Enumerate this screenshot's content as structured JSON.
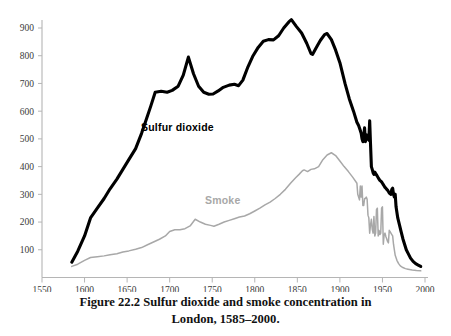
{
  "figure": {
    "caption_line1": "Figure 22.2 Sulfur dioxide and smoke concentration in",
    "caption_line2": "London, 1585–2000."
  },
  "colors": {
    "sulfur_dioxide": "#000000",
    "smoke": "#a8a8a8",
    "axis": "#b5b5b5",
    "tick_text": "#3a3a3a",
    "background": "#ffffff"
  },
  "chart_data": {
    "type": "line",
    "title": "Figure 22.2 Sulfur dioxide and smoke concentration in London, 1585–2000.",
    "xlabel": "",
    "ylabel": "",
    "xlim": [
      1550,
      2000
    ],
    "ylim": [
      0,
      960
    ],
    "grid": false,
    "legend": "inline-annotations",
    "xticks": [
      1550,
      1600,
      1650,
      1700,
      1750,
      1800,
      1850,
      1900,
      1950,
      2000
    ],
    "yticks": [
      100,
      200,
      300,
      400,
      500,
      600,
      700,
      800,
      900
    ],
    "xtick_labels": [
      "1550",
      "1600",
      "1650",
      "1700",
      "1750",
      "1800",
      "1850",
      "1900",
      "1950",
      "2000"
    ],
    "ytick_labels": [
      "900",
      "800",
      "700",
      "600",
      "500",
      "400",
      "300",
      "200",
      "100"
    ],
    "annotations": [
      {
        "text": "Sulfur dioxide",
        "x": 1700,
        "y": 540,
        "series": "Sulfur dioxide"
      },
      {
        "text": "Smoke",
        "x": 1795,
        "y": 290,
        "series": "Smoke"
      }
    ],
    "series": [
      {
        "name": "Sulfur dioxide",
        "color": "#000000",
        "linewidth": 3.1,
        "x": [
          1585,
          1592,
          1600,
          1607,
          1615,
          1623,
          1630,
          1638,
          1645,
          1652,
          1660,
          1667,
          1672,
          1678,
          1683,
          1690,
          1697,
          1703,
          1710,
          1716,
          1722,
          1728,
          1734,
          1740,
          1746,
          1751,
          1757,
          1763,
          1770,
          1776,
          1781,
          1786,
          1792,
          1798,
          1804,
          1810,
          1816,
          1822,
          1828,
          1834,
          1840,
          1843,
          1849,
          1855,
          1861,
          1866,
          1868,
          1872,
          1877,
          1882,
          1885,
          1890,
          1895,
          1900,
          1906,
          1911,
          1916,
          1920,
          1922,
          1924,
          1925,
          1926,
          1927,
          1928,
          1929,
          1930,
          1931,
          1932,
          1933,
          1934,
          1935,
          1936,
          1937,
          1938,
          1939,
          1940,
          1941,
          1942,
          1943,
          1944,
          1945,
          1946,
          1947,
          1948,
          1949,
          1950,
          1951,
          1952,
          1953,
          1954,
          1955,
          1956,
          1957,
          1958,
          1959,
          1960,
          1961,
          1962,
          1963,
          1964,
          1965,
          1966,
          1968,
          1970,
          1972,
          1974,
          1976,
          1978,
          1980,
          1983,
          1986,
          1989,
          1992,
          1995
        ],
        "y": [
          55,
          95,
          150,
          215,
          250,
          285,
          320,
          355,
          390,
          425,
          465,
          520,
          565,
          620,
          668,
          672,
          668,
          675,
          690,
          730,
          795,
          735,
          690,
          668,
          661,
          662,
          673,
          686,
          694,
          697,
          692,
          712,
          760,
          800,
          830,
          852,
          858,
          857,
          872,
          900,
          922,
          930,
          905,
          882,
          845,
          808,
          805,
          828,
          855,
          876,
          880,
          858,
          820,
          775,
          700,
          645,
          600,
          560,
          548,
          530,
          520,
          500,
          490,
          510,
          540,
          490,
          515,
          505,
          500,
          495,
          565,
          480,
          400,
          390,
          378,
          372,
          380,
          375,
          370,
          365,
          360,
          355,
          350,
          348,
          345,
          340,
          335,
          330,
          325,
          322,
          318,
          315,
          310,
          305,
          302,
          300,
          318,
          322,
          300,
          290,
          300,
          255,
          215,
          190,
          165,
          140,
          120,
          100,
          88,
          70,
          58,
          50,
          45,
          40
        ]
      },
      {
        "name": "Smoke",
        "color": "#a8a8a8",
        "linewidth": 1.5,
        "x": [
          1585,
          1592,
          1600,
          1607,
          1615,
          1623,
          1630,
          1638,
          1645,
          1652,
          1660,
          1667,
          1674,
          1681,
          1688,
          1695,
          1700,
          1706,
          1712,
          1718,
          1724,
          1730,
          1736,
          1742,
          1748,
          1752,
          1758,
          1764,
          1770,
          1776,
          1782,
          1788,
          1794,
          1800,
          1806,
          1812,
          1818,
          1824,
          1830,
          1836,
          1842,
          1848,
          1852,
          1856,
          1858,
          1862,
          1866,
          1870,
          1875,
          1880,
          1885,
          1890,
          1895,
          1900,
          1905,
          1910,
          1915,
          1920,
          1921,
          1922,
          1923,
          1924,
          1925,
          1926,
          1927,
          1928,
          1929,
          1930,
          1931,
          1932,
          1933,
          1934,
          1935,
          1936,
          1937,
          1938,
          1939,
          1940,
          1941,
          1942,
          1943,
          1944,
          1945,
          1946,
          1947,
          1948,
          1949,
          1950,
          1951,
          1952,
          1953,
          1954,
          1955,
          1956,
          1957,
          1958,
          1959,
          1960,
          1961,
          1962,
          1963,
          1964,
          1965,
          1967,
          1969,
          1971,
          1974,
          1977,
          1980,
          1985,
          1990,
          1995
        ],
        "y": [
          40,
          48,
          62,
          72,
          75,
          78,
          82,
          86,
          92,
          96,
          102,
          108,
          118,
          128,
          138,
          150,
          166,
          172,
          172,
          176,
          186,
          210,
          200,
          192,
          188,
          185,
          192,
          200,
          206,
          212,
          218,
          222,
          230,
          240,
          250,
          262,
          272,
          285,
          300,
          318,
          340,
          360,
          372,
          385,
          388,
          382,
          390,
          392,
          400,
          425,
          442,
          450,
          440,
          420,
          400,
          382,
          362,
          340,
          300,
          290,
          280,
          330,
          290,
          330,
          260,
          260,
          285,
          285,
          290,
          282,
          225,
          215,
          160,
          190,
          210,
          175,
          160,
          220,
          150,
          160,
          245,
          250,
          150,
          170,
          155,
          160,
          250,
          255,
          120,
          155,
          160,
          148,
          140,
          130,
          125,
          170,
          165,
          160,
          155,
          150,
          120,
          100,
          80,
          62,
          50,
          42,
          36,
          32,
          30,
          27,
          25,
          24
        ]
      }
    ]
  },
  "axis_geometry": {
    "x_min_px": 42,
    "x_max_px": 425,
    "y_zero_px": 277.5,
    "y_900_px": 28
  }
}
